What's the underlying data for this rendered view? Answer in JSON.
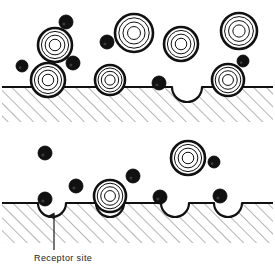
{
  "figure": {
    "title": "",
    "background": "#ffffff",
    "ink": "#111111",
    "hatch_color": "#5a5a5a",
    "width": 275,
    "height": 268
  },
  "labels": {
    "receptor_site": "Receptor site"
  },
  "legend_semantics": {
    "ring_particle": "concentric-ring-particle",
    "dark_particle": "solid-dark-particle",
    "surface": "membrane-surface",
    "dip": "receptor-site-dip"
  },
  "chart_data": {
    "type": "diagram",
    "panels": [
      {
        "name": "top-panel",
        "surface_y": 87,
        "hatch_bottom": 122,
        "surface_x_start": 2,
        "surface_x_end": 273,
        "dips": [
          {
            "cx": 187,
            "r": 15,
            "occupied_by": "none"
          }
        ],
        "bound_rings": [
          {
            "cx": 48,
            "cy": 80,
            "r": 17
          },
          {
            "cx": 110,
            "cy": 80,
            "r": 15
          },
          {
            "cx": 228,
            "cy": 80,
            "r": 16
          }
        ],
        "free_rings": [
          {
            "cx": 55,
            "cy": 45,
            "r": 17
          },
          {
            "cx": 134,
            "cy": 33,
            "r": 19
          },
          {
            "cx": 181,
            "cy": 44,
            "r": 17
          },
          {
            "cx": 239,
            "cy": 31,
            "r": 18
          }
        ],
        "dark_particles": [
          {
            "cx": 66,
            "cy": 22,
            "r": 7
          },
          {
            "cx": 107,
            "cy": 42,
            "r": 7
          },
          {
            "cx": 73,
            "cy": 63,
            "r": 7
          },
          {
            "cx": 22,
            "cy": 66,
            "r": 6
          },
          {
            "cx": 243,
            "cy": 61,
            "r": 6
          },
          {
            "cx": 159,
            "cy": 83,
            "r": 7
          }
        ]
      },
      {
        "name": "bottom-panel",
        "surface_y": 203,
        "hatch_bottom": 243,
        "surface_x_start": 2,
        "surface_x_end": 273,
        "dips": [
          {
            "cx": 52,
            "r": 14,
            "occupied_by": "none"
          },
          {
            "cx": 110,
            "r": 14,
            "occupied_by": "ring"
          },
          {
            "cx": 175,
            "r": 14,
            "occupied_by": "none"
          },
          {
            "cx": 228,
            "r": 14,
            "occupied_by": "none"
          }
        ],
        "bound_rings": [
          {
            "cx": 110,
            "cy": 196,
            "r": 16
          }
        ],
        "free_rings": [
          {
            "cx": 188,
            "cy": 158,
            "r": 17
          }
        ],
        "dark_particles": [
          {
            "cx": 45,
            "cy": 153,
            "r": 7
          },
          {
            "cx": 76,
            "cy": 186,
            "r": 7
          },
          {
            "cx": 133,
            "cy": 176,
            "r": 7
          },
          {
            "cx": 214,
            "cy": 162,
            "r": 6
          },
          {
            "cx": 160,
            "cy": 197,
            "r": 7
          },
          {
            "cx": 220,
            "cy": 196,
            "r": 7
          },
          {
            "cx": 45,
            "cy": 199,
            "r": 7
          }
        ],
        "annotation": {
          "label_key": "receptor_site",
          "text_x": 34,
          "text_y": 261,
          "arrow_from_x": 54,
          "arrow_from_y": 250,
          "arrow_to_x": 54,
          "arrow_to_y": 216
        }
      }
    ]
  }
}
